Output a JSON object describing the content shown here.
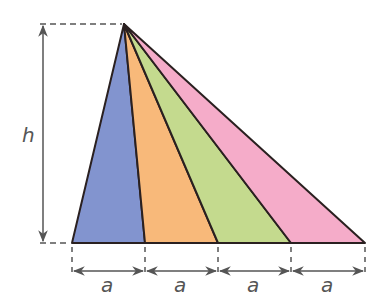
{
  "diagram": {
    "height_label": "h",
    "base_labels": [
      "a",
      "a",
      "a",
      "a"
    ],
    "apex": [
      124,
      24
    ],
    "base_y": 243,
    "base_x": [
      72,
      145,
      218,
      291,
      365
    ],
    "colors": {
      "triangle_1": "#8294cf",
      "triangle_2": "#f8b97a",
      "triangle_3": "#c4da8e",
      "triangle_4": "#f5acc9",
      "outline": "#2a2020",
      "dimension": "#555555"
    }
  }
}
